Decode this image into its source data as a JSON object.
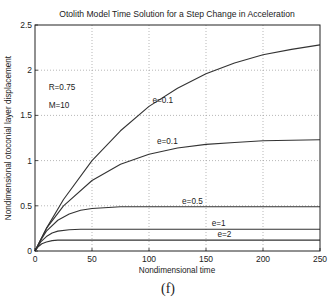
{
  "chart_data": {
    "type": "line",
    "title": "Otolith Model Time Solution for a Step Change in Acceleration",
    "xlabel": "Nondimensional time",
    "ylabel": "Nondimensional otoconial layer displacement",
    "xlim": [
      0,
      250
    ],
    "ylim": [
      0,
      2.5
    ],
    "xticks": [
      0,
      50,
      100,
      150,
      200,
      250
    ],
    "yticks": [
      0,
      0.5,
      1,
      1.5,
      2,
      2.5
    ],
    "ytick_labels": [
      "0",
      "0.5",
      "1",
      "1.5",
      "2",
      "2.5"
    ],
    "grid": true,
    "legend": "none",
    "annotations": [
      {
        "text": "R=0.75",
        "x": 12,
        "y": 1.78
      },
      {
        "text": "M=10",
        "x": 12,
        "y": 1.58
      },
      {
        "text": "e=0.1",
        "x": 103,
        "y": 1.64
      },
      {
        "text": "e=0.1",
        "x": 107,
        "y": 1.18
      },
      {
        "text": "e=0.5",
        "x": 129,
        "y": 0.52
      },
      {
        "text": "e=1",
        "x": 155,
        "y": 0.28
      },
      {
        "text": "e=2",
        "x": 160,
        "y": 0.16
      }
    ],
    "series": [
      {
        "name": "e=0.1 (upper)",
        "x": [
          0,
          10,
          25,
          50,
          75,
          100,
          125,
          150,
          175,
          200,
          225,
          250
        ],
        "y": [
          0,
          0.25,
          0.57,
          1.0,
          1.33,
          1.6,
          1.8,
          1.96,
          2.08,
          2.17,
          2.23,
          2.28
        ]
      },
      {
        "name": "e=0.1 (lower)",
        "x": [
          0,
          10,
          25,
          50,
          75,
          100,
          125,
          150,
          175,
          200,
          225,
          250
        ],
        "y": [
          0,
          0.25,
          0.5,
          0.78,
          0.96,
          1.07,
          1.14,
          1.18,
          1.2,
          1.22,
          1.225,
          1.23
        ]
      },
      {
        "name": "e=0.5",
        "x": [
          0,
          5,
          10,
          20,
          30,
          40,
          50,
          75,
          100,
          150,
          200,
          250
        ],
        "y": [
          0,
          0.12,
          0.22,
          0.34,
          0.41,
          0.45,
          0.47,
          0.49,
          0.49,
          0.49,
          0.49,
          0.49
        ]
      },
      {
        "name": "e=1",
        "x": [
          0,
          5,
          10,
          15,
          20,
          30,
          40,
          60,
          100,
          150,
          200,
          250
        ],
        "y": [
          0,
          0.1,
          0.16,
          0.2,
          0.22,
          0.235,
          0.24,
          0.24,
          0.24,
          0.24,
          0.24,
          0.24
        ]
      },
      {
        "name": "e=2",
        "x": [
          0,
          3,
          6,
          10,
          15,
          20,
          30,
          50,
          100,
          150,
          200,
          250
        ],
        "y": [
          0,
          0.05,
          0.08,
          0.1,
          0.115,
          0.12,
          0.12,
          0.12,
          0.12,
          0.12,
          0.12,
          0.12
        ]
      }
    ]
  },
  "caption": "(f)"
}
